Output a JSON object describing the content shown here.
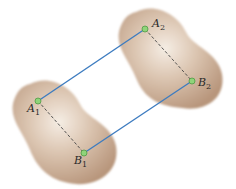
{
  "diagram": {
    "colors": {
      "body_fill": "#c8ab93",
      "body_highlight": "#f3e9df",
      "body_edge": "#b39278",
      "connector_line": "#3d7cc0",
      "dashed_line": "#444444",
      "point_fill": "#8fd47a",
      "point_stroke": "#4f9a44"
    },
    "bodies": [
      {
        "name": "body-position-1"
      },
      {
        "name": "body-position-2"
      }
    ],
    "points": [
      {
        "id": "A1",
        "letter": "A",
        "sub": "1",
        "x": 38,
        "y": 101
      },
      {
        "id": "B1",
        "letter": "B",
        "sub": "1",
        "x": 84,
        "y": 153
      },
      {
        "id": "A2",
        "letter": "A",
        "sub": "2",
        "x": 145,
        "y": 29
      },
      {
        "id": "B2",
        "letter": "B",
        "sub": "2",
        "x": 192,
        "y": 81
      }
    ],
    "solid_lines": [
      {
        "from": "A1",
        "to": "A2"
      },
      {
        "from": "B1",
        "to": "B2"
      }
    ],
    "dashed_lines": [
      {
        "from": "A1",
        "to": "B1"
      },
      {
        "from": "A2",
        "to": "B2"
      }
    ]
  }
}
